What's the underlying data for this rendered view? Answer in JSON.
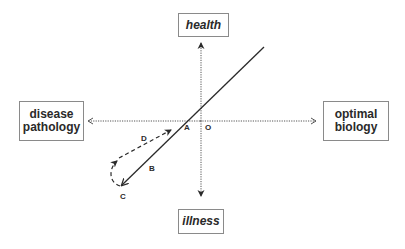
{
  "diagram": {
    "boxes": {
      "health": {
        "label": "health"
      },
      "illness": {
        "label": "illness"
      },
      "disease": {
        "line1": "disease",
        "line2": "pathology"
      },
      "optimal": {
        "line1": "optimal",
        "line2": "biology"
      }
    },
    "points": {
      "A": "A",
      "B": "B",
      "C": "C",
      "D": "D",
      "O": "O"
    },
    "colors": {
      "line": "#2a2a2a",
      "axis": "#555555",
      "box_border": "#8a8a8a"
    }
  }
}
